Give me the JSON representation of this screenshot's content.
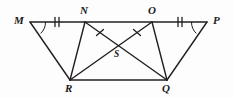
{
  "figure": {
    "type": "geometry-diagram",
    "width": 234,
    "height": 98,
    "background_color": "#fdfdfd",
    "stroke_color": "#231f20",
    "stroke_width": 1.4,
    "vertices": [
      {
        "id": "M",
        "label": "M",
        "x": 30,
        "y": 22,
        "label_x": 14,
        "label_y": 16
      },
      {
        "id": "N",
        "label": "N",
        "x": 85,
        "y": 22,
        "label_x": 80,
        "label_y": 6
      },
      {
        "id": "O",
        "label": "O",
        "x": 152,
        "y": 22,
        "label_x": 148,
        "label_y": 6
      },
      {
        "id": "P",
        "label": "P",
        "x": 207,
        "y": 22,
        "label_x": 213,
        "label_y": 16
      },
      {
        "id": "R",
        "label": "R",
        "x": 70,
        "y": 80,
        "label_x": 65,
        "label_y": 84
      },
      {
        "id": "Q",
        "label": "Q",
        "x": 167,
        "y": 80,
        "label_x": 162,
        "label_y": 84
      },
      {
        "id": "S",
        "label": "S",
        "x": 119,
        "y": 48,
        "label_x": 113,
        "label_y": 50
      }
    ],
    "segments": [
      {
        "id": "MP",
        "from": "M",
        "to": "P",
        "note": "top horizontal line through N and O"
      },
      {
        "id": "MR",
        "from": "M",
        "to": "R"
      },
      {
        "id": "NR",
        "from": "N",
        "to": "R"
      },
      {
        "id": "NQ",
        "from": "N",
        "to": "Q",
        "note": "diagonal through S"
      },
      {
        "id": "OR",
        "from": "O",
        "to": "R",
        "note": "diagonal through S"
      },
      {
        "id": "OQ",
        "from": "O",
        "to": "Q"
      },
      {
        "id": "PQ",
        "from": "P",
        "to": "Q"
      },
      {
        "id": "RQ",
        "from": "R",
        "to": "Q",
        "note": "bottom horizontal line"
      }
    ],
    "tick_marks": [
      {
        "id": "tick-mn",
        "segment": "MN",
        "count": 2,
        "x": 57,
        "y": 22,
        "orientation": "vertical"
      },
      {
        "id": "tick-op",
        "segment": "OP",
        "count": 2,
        "x": 180,
        "y": 22,
        "orientation": "vertical"
      },
      {
        "id": "tick-nq",
        "segment": "NQ",
        "count": 1,
        "x": 100,
        "y": 33,
        "orientation": "cross"
      },
      {
        "id": "tick-or",
        "segment": "OR",
        "count": 1,
        "x": 137,
        "y": 33,
        "orientation": "cross"
      }
    ],
    "angle_arcs": [
      {
        "id": "arc-m",
        "vertex": "M",
        "note": "angle arc at M between MP and MR"
      },
      {
        "id": "arc-p",
        "vertex": "P",
        "note": "angle arc at P between MP and PQ"
      }
    ]
  }
}
